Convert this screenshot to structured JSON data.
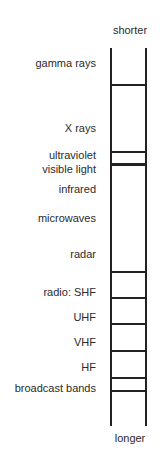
{
  "diagram": {
    "title_top": "shorter",
    "title_bottom": "longer",
    "bands": [
      {
        "label": "gamma rays",
        "y": 57
      },
      {
        "label": "X rays",
        "y": 122
      },
      {
        "label": "ultraviolet",
        "y": 149
      },
      {
        "label": "visible light",
        "y": 163
      },
      {
        "label": "infrared",
        "y": 183
      },
      {
        "label": "microwaves",
        "y": 212
      },
      {
        "label": "radar",
        "y": 248
      },
      {
        "label": "radio: SHF",
        "y": 286
      },
      {
        "label": "UHF",
        "y": 311
      },
      {
        "label": "VHF",
        "y": 336
      },
      {
        "label": "HF",
        "y": 361
      },
      {
        "label": "broadcast bands",
        "y": 382
      }
    ],
    "rungs": [
      {
        "y": 84,
        "thick": false
      },
      {
        "y": 151,
        "thick": false
      },
      {
        "y": 163,
        "thick": true
      },
      {
        "y": 271,
        "thick": false
      },
      {
        "y": 297,
        "thick": false
      },
      {
        "y": 323,
        "thick": false
      },
      {
        "y": 350,
        "thick": false
      },
      {
        "y": 377,
        "thick": false
      },
      {
        "y": 390,
        "thick": false
      }
    ]
  }
}
